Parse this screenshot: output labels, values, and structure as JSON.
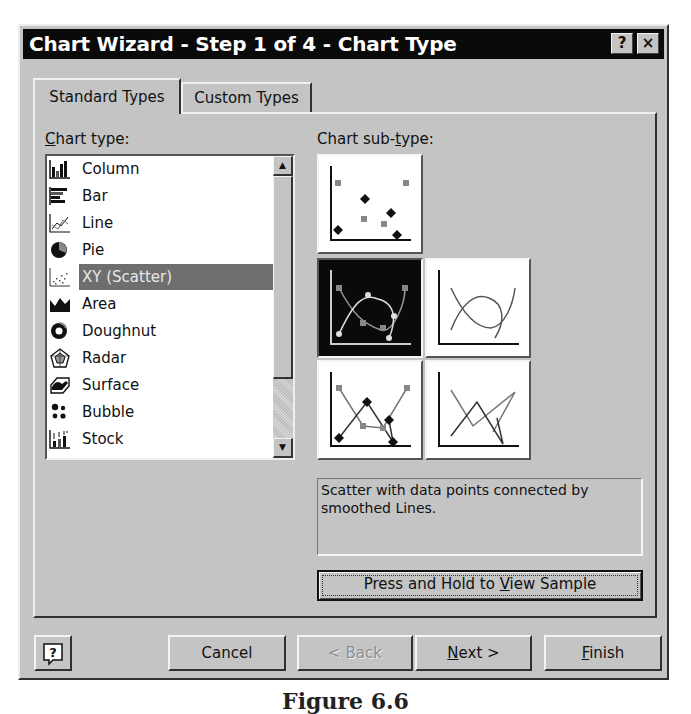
{
  "window": {
    "title": "Chart Wizard - Step 1 of 4 - Chart Type",
    "help_button": "?",
    "close_button": "×"
  },
  "tabs": [
    {
      "label": "Standard Types",
      "active": true
    },
    {
      "label": "Custom Types",
      "active": false
    }
  ],
  "chart_type": {
    "label_prefix": "C",
    "label_rest": "hart type:",
    "items": [
      {
        "label": "Column",
        "icon": "column-chart-icon"
      },
      {
        "label": "Bar",
        "icon": "bar-chart-icon"
      },
      {
        "label": "Line",
        "icon": "line-chart-icon"
      },
      {
        "label": "Pie",
        "icon": "pie-chart-icon"
      },
      {
        "label": "XY (Scatter)",
        "icon": "scatter-chart-icon",
        "selected": true
      },
      {
        "label": "Area",
        "icon": "area-chart-icon"
      },
      {
        "label": "Doughnut",
        "icon": "doughnut-chart-icon"
      },
      {
        "label": "Radar",
        "icon": "radar-chart-icon"
      },
      {
        "label": "Surface",
        "icon": "surface-chart-icon"
      },
      {
        "label": "Bubble",
        "icon": "bubble-chart-icon"
      },
      {
        "label": "Stock",
        "icon": "stock-chart-icon"
      }
    ]
  },
  "chart_subtype": {
    "label_before": "Chart sub-",
    "label_underlined": "t",
    "label_after": "ype:",
    "options": [
      {
        "name": "scatter-markers-only",
        "selected": false
      },
      {
        "name": "scatter-smoothed-lines-markers",
        "selected": true
      },
      {
        "name": "scatter-smoothed-lines",
        "selected": false
      },
      {
        "name": "scatter-straight-lines-markers",
        "selected": false
      },
      {
        "name": "scatter-straight-lines",
        "selected": false
      }
    ],
    "description": "Scatter with data points connected by smoothed Lines."
  },
  "sample_button": {
    "before": "Press and Hold to ",
    "underlined": "V",
    "after": "iew Sample"
  },
  "footer": {
    "help_icon": "?",
    "cancel": "Cancel",
    "back": "< Back",
    "next_u": "N",
    "next_rest": "ext >",
    "finish_u": "F",
    "finish_rest": "inish"
  },
  "caption": "Figure 6.6"
}
